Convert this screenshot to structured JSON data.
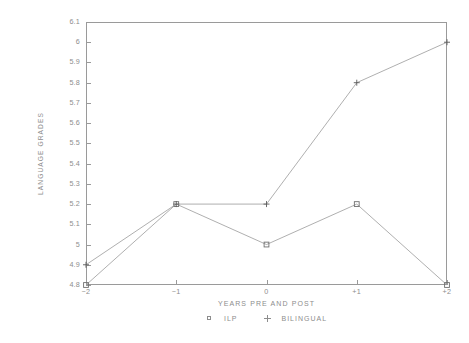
{
  "chart_data": {
    "type": "line",
    "title": "",
    "xlabel": "YEARS PRE AND POST",
    "ylabel": "LANGUAGE GRADES",
    "categories": [
      "-2",
      "-1",
      "0",
      "+1",
      "+2"
    ],
    "x": [
      -2,
      -1,
      0,
      1,
      2
    ],
    "xtick_labels": [
      "−2",
      "−1",
      "0",
      "+1",
      "+2"
    ],
    "ytick_labels": [
      "6.1",
      "6",
      "5.9",
      "5.8",
      "5.7",
      "5.6",
      "5.5",
      "5.4",
      "5.3",
      "5.2",
      "5.1",
      "5",
      "4.9",
      "4.8"
    ],
    "ytick_values": [
      6.1,
      6.0,
      5.9,
      5.8,
      5.7,
      5.6,
      5.5,
      5.4,
      5.3,
      5.2,
      5.1,
      5.0,
      4.9,
      4.8
    ],
    "ylim": [
      4.8,
      6.1
    ],
    "xlim": [
      -2,
      2
    ],
    "grid": false,
    "legend_position": "bottom-center",
    "series": [
      {
        "name": "ILP",
        "marker": "square",
        "values": [
          4.8,
          5.2,
          5.0,
          5.2,
          4.8
        ]
      },
      {
        "name": "BILINGUAL",
        "marker": "plus",
        "values": [
          4.9,
          5.2,
          5.2,
          5.8,
          6.0
        ]
      }
    ],
    "colors": {
      "axis": "#9a9a9a",
      "text": "#8d8d8d",
      "line": "#9a9a9a",
      "marker_ilp": "#6f6f6f",
      "marker_bilingual": "#5a5a5a",
      "background": "#ffffff"
    }
  },
  "legend": {
    "items": [
      {
        "label": "ILP",
        "symbol": "square"
      },
      {
        "label": "BILINGUAL",
        "symbol": "plus"
      }
    ]
  }
}
